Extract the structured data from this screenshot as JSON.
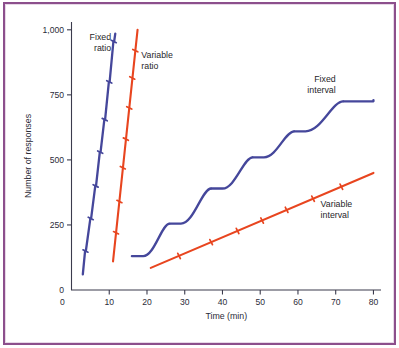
{
  "figure": {
    "frame_color": "#8c4f8c",
    "background": "#ffffff"
  },
  "chart_data": {
    "type": "line",
    "title": "",
    "xlabel": "Time (min)",
    "ylabel": "Number of responses",
    "xlim": [
      0,
      82
    ],
    "ylim": [
      0,
      1030
    ],
    "xticks": [
      0,
      10,
      20,
      30,
      40,
      50,
      60,
      70,
      80
    ],
    "xticklabels": [
      "0",
      "10",
      "20",
      "30",
      "40",
      "50",
      "60",
      "70",
      "80"
    ],
    "yticks": [
      0,
      250,
      500,
      750,
      1000
    ],
    "yticklabels": [
      "0",
      "250",
      "500",
      "750",
      "1,000"
    ],
    "grid": false,
    "legend_position": "inline-annotations",
    "colors": {
      "blue": "#45479b",
      "red": "#e8451f"
    },
    "series": [
      {
        "name": "Fixed ratio",
        "color": "#45479b",
        "label": "Fixed ratio",
        "label_lines": [
          "Fixed",
          "ratio"
        ],
        "label_x": 10.5,
        "label_y": 960,
        "label_align": "right",
        "style": "stepped-steep",
        "x": [
          3.0,
          3.6,
          3.8,
          5.0,
          5.2,
          6.3,
          6.5,
          7.5,
          7.7,
          8.7,
          8.9,
          9.9,
          10.1,
          11.1,
          11.3,
          11.6
        ],
        "y": [
          60,
          150,
          150,
          275,
          275,
          400,
          400,
          530,
          530,
          655,
          655,
          800,
          800,
          955,
          955,
          985
        ],
        "reinforcement_marks": [
          {
            "x": 3.7,
            "y": 150
          },
          {
            "x": 5.1,
            "y": 275
          },
          {
            "x": 6.4,
            "y": 400
          },
          {
            "x": 7.6,
            "y": 530
          },
          {
            "x": 8.8,
            "y": 655
          },
          {
            "x": 10.0,
            "y": 800
          },
          {
            "x": 11.2,
            "y": 955
          }
        ]
      },
      {
        "name": "Variable ratio",
        "color": "#e8451f",
        "label": "Variable ratio",
        "label_lines": [
          "Variable",
          "ratio"
        ],
        "label_x": 18.5,
        "label_y": 890,
        "label_align": "left",
        "style": "straight-steep",
        "x": [
          11.0,
          17.5
        ],
        "y": [
          110,
          1000
        ],
        "reinforcement_marks": [
          {
            "x": 11.8,
            "y": 220
          },
          {
            "x": 12.7,
            "y": 340
          },
          {
            "x": 13.6,
            "y": 470
          },
          {
            "x": 14.4,
            "y": 580
          },
          {
            "x": 15.3,
            "y": 700
          },
          {
            "x": 16.1,
            "y": 815
          },
          {
            "x": 16.9,
            "y": 920
          }
        ]
      },
      {
        "name": "Fixed interval",
        "color": "#45479b",
        "label": "Fixed interval",
        "label_lines": [
          "Fixed",
          "interval"
        ],
        "label_x": 70.0,
        "label_y": 800,
        "label_align": "right",
        "style": "scalloped",
        "scallops": [
          {
            "pause_start_x": 16.0,
            "pause_end_x": 19.0,
            "rise_end_x": 26.0,
            "plateau_y": 130,
            "top_y": 255
          },
          {
            "pause_start_x": 26.0,
            "pause_end_x": 29.0,
            "rise_end_x": 37.0,
            "plateau_y": 255,
            "top_y": 390
          },
          {
            "pause_start_x": 37.0,
            "pause_end_x": 40.0,
            "rise_end_x": 48.0,
            "plateau_y": 390,
            "top_y": 510
          },
          {
            "pause_start_x": 48.0,
            "pause_end_x": 51.0,
            "rise_end_x": 59.0,
            "plateau_y": 510,
            "top_y": 610
          },
          {
            "pause_start_x": 59.0,
            "pause_end_x": 62.0,
            "rise_end_x": 72.0,
            "plateau_y": 610,
            "top_y": 725
          },
          {
            "pause_start_x": 72.0,
            "pause_end_x": 80.0,
            "rise_end_x": 80.0,
            "plateau_y": 725,
            "top_y": 730
          }
        ],
        "reinforcement_marks": [
          {
            "x": 26.0,
            "y": 255
          },
          {
            "x": 37.0,
            "y": 390
          },
          {
            "x": 48.0,
            "y": 510
          },
          {
            "x": 59.0,
            "y": 610
          },
          {
            "x": 72.0,
            "y": 725
          }
        ]
      },
      {
        "name": "Variable interval",
        "color": "#e8451f",
        "label": "Variable interval",
        "label_lines": [
          "Variable",
          "interval"
        ],
        "label_x": 66.0,
        "label_y": 320,
        "label_align": "left",
        "style": "straight-shallow",
        "x": [
          21.0,
          80.0
        ],
        "y": [
          85,
          450
        ],
        "reinforcement_marks": [
          {
            "x": 28.5,
            "y": 131
          },
          {
            "x": 37.0,
            "y": 184
          },
          {
            "x": 44.0,
            "y": 227
          },
          {
            "x": 50.5,
            "y": 267
          },
          {
            "x": 57.0,
            "y": 308
          },
          {
            "x": 64.0,
            "y": 351
          },
          {
            "x": 71.5,
            "y": 397
          }
        ]
      }
    ]
  }
}
